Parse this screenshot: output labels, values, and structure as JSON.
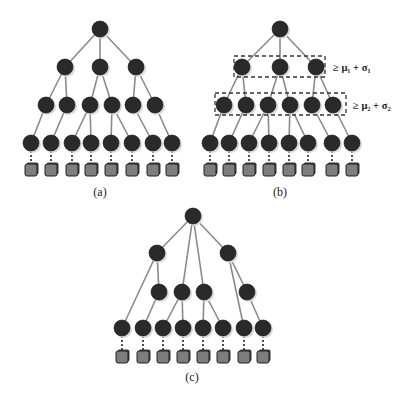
{
  "figure": {
    "panels": [
      {
        "id": "a",
        "caption": "(a)",
        "caption_pos": [
          100,
          196
        ],
        "levels": [
          {
            "y": 29,
            "x": [
              100
            ]
          },
          {
            "y": 67,
            "x": [
              65,
              100,
              136
            ]
          },
          {
            "y": 105,
            "x": [
              46,
              67,
              90,
              112,
              133,
              155
            ]
          },
          {
            "y": 143,
            "x": [
              31,
              51,
              72,
              91,
              111,
              132,
              153,
              172
            ]
          }
        ],
        "edges": [
          [
            [
              0,
              0
            ],
            [
              1,
              0
            ]
          ],
          [
            [
              0,
              0
            ],
            [
              1,
              1
            ]
          ],
          [
            [
              0,
              0
            ],
            [
              1,
              2
            ]
          ],
          [
            [
              1,
              0
            ],
            [
              2,
              0
            ]
          ],
          [
            [
              1,
              0
            ],
            [
              2,
              1
            ]
          ],
          [
            [
              1,
              1
            ],
            [
              2,
              2
            ]
          ],
          [
            [
              1,
              1
            ],
            [
              2,
              3
            ]
          ],
          [
            [
              1,
              2
            ],
            [
              2,
              4
            ]
          ],
          [
            [
              1,
              2
            ],
            [
              2,
              5
            ]
          ],
          [
            [
              2,
              0
            ],
            [
              3,
              0
            ]
          ],
          [
            [
              2,
              1
            ],
            [
              3,
              1
            ]
          ],
          [
            [
              2,
              2
            ],
            [
              3,
              2
            ]
          ],
          [
            [
              2,
              2
            ],
            [
              3,
              3
            ]
          ],
          [
            [
              2,
              3
            ],
            [
              3,
              4
            ]
          ],
          [
            [
              2,
              3
            ],
            [
              3,
              5
            ]
          ],
          [
            [
              2,
              4
            ],
            [
              3,
              6
            ]
          ],
          [
            [
              2,
              5
            ],
            [
              3,
              7
            ]
          ]
        ],
        "leaf_y": 170,
        "boxes": []
      },
      {
        "id": "b",
        "caption": "(b)",
        "caption_pos": [
          280,
          196
        ],
        "levels": [
          {
            "y": 29,
            "x": [
              280
            ]
          },
          {
            "y": 67,
            "x": [
              242,
              280,
              316
            ]
          },
          {
            "y": 105,
            "x": [
              224,
              246,
              268,
              290,
              312,
              333
            ]
          },
          {
            "y": 143,
            "x": [
              210,
              229,
              249,
              269,
              289,
              308,
              332,
              352
            ]
          }
        ],
        "edges": [
          [
            [
              0,
              0
            ],
            [
              1,
              0
            ]
          ],
          [
            [
              0,
              0
            ],
            [
              1,
              1
            ]
          ],
          [
            [
              0,
              0
            ],
            [
              1,
              2
            ]
          ],
          [
            [
              1,
              0
            ],
            [
              2,
              0
            ]
          ],
          [
            [
              1,
              0
            ],
            [
              2,
              1
            ]
          ],
          [
            [
              1,
              1
            ],
            [
              2,
              2
            ]
          ],
          [
            [
              1,
              1
            ],
            [
              2,
              3
            ]
          ],
          [
            [
              1,
              2
            ],
            [
              2,
              4
            ]
          ],
          [
            [
              1,
              2
            ],
            [
              2,
              5
            ]
          ],
          [
            [
              2,
              0
            ],
            [
              3,
              0
            ]
          ],
          [
            [
              2,
              1
            ],
            [
              3,
              1
            ]
          ],
          [
            [
              2,
              2
            ],
            [
              3,
              2
            ]
          ],
          [
            [
              2,
              2
            ],
            [
              3,
              3
            ]
          ],
          [
            [
              2,
              3
            ],
            [
              3,
              4
            ]
          ],
          [
            [
              2,
              3
            ],
            [
              3,
              5
            ]
          ],
          [
            [
              2,
              4
            ],
            [
              3,
              6
            ]
          ],
          [
            [
              2,
              5
            ],
            [
              3,
              7
            ]
          ]
        ],
        "leaf_y": 170,
        "boxes": [
          {
            "x": 234,
            "y": 56,
            "w": 91,
            "h": 21,
            "label": "≥ μ₁ + σ₁",
            "label_x": 333,
            "label_y": 71
          },
          {
            "x": 215,
            "y": 93,
            "w": 131,
            "h": 22,
            "label": "≥ μ₂ + σ₂",
            "label_x": 353,
            "label_y": 109
          }
        ]
      },
      {
        "id": "c",
        "caption": "(c)",
        "caption_pos": [
          192,
          381
        ],
        "levels": [
          {
            "y": 216,
            "x": [
              193
            ]
          },
          {
            "y": 253,
            "x": [
              157,
              228
            ]
          },
          {
            "y": 292,
            "x": [
              159,
              182,
              204,
              247
            ]
          },
          {
            "y": 328,
            "x": [
              122,
              143,
              163,
              183,
              203,
              223,
              244,
              263
            ]
          }
        ],
        "edges": [
          [
            [
              0,
              0
            ],
            [
              1,
              0
            ]
          ],
          [
            [
              0,
              0
            ],
            [
              2,
              1
            ]
          ],
          [
            [
              0,
              0
            ],
            [
              2,
              2
            ]
          ],
          [
            [
              0,
              0
            ],
            [
              1,
              1
            ]
          ],
          [
            [
              1,
              0
            ],
            [
              3,
              0
            ]
          ],
          [
            [
              1,
              0
            ],
            [
              2,
              0
            ]
          ],
          [
            [
              2,
              0
            ],
            [
              3,
              1
            ]
          ],
          [
            [
              2,
              1
            ],
            [
              3,
              2
            ]
          ],
          [
            [
              2,
              1
            ],
            [
              3,
              3
            ]
          ],
          [
            [
              2,
              2
            ],
            [
              3,
              4
            ]
          ],
          [
            [
              2,
              2
            ],
            [
              3,
              5
            ]
          ],
          [
            [
              1,
              1
            ],
            [
              3,
              6
            ]
          ],
          [
            [
              1,
              1
            ],
            [
              2,
              3
            ]
          ],
          [
            [
              2,
              3
            ],
            [
              3,
              7
            ]
          ]
        ],
        "leaf_y": 357,
        "boxes": []
      }
    ]
  },
  "style": {
    "node_color": "#2a2a2a",
    "leaf_color": "#7d7d7d",
    "edge_color": "#8a8a8a",
    "node_radius": 8,
    "leaf_size": 12
  }
}
